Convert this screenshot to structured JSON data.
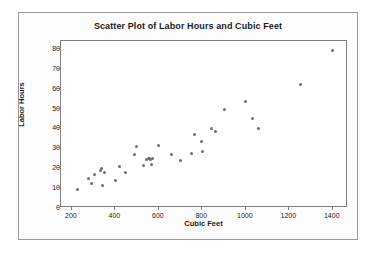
{
  "chart_data": {
    "type": "scatter",
    "title": "Scatter Plot of Labor Hours and Cubic Feet",
    "xlabel": "Cubic Feet",
    "ylabel": "Labor Hours",
    "xlim": [
      150,
      1470
    ],
    "ylim": [
      0,
      84
    ],
    "xticks": [
      200,
      400,
      600,
      800,
      1000,
      1200,
      1400
    ],
    "xtick_labels": [
      "200",
      "400",
      "600",
      "800",
      "1000",
      "1200",
      "1400"
    ],
    "yticks": [
      0,
      10,
      20,
      30,
      40,
      50,
      60,
      70,
      80
    ],
    "ytick_labels": [
      "0",
      "10",
      "20",
      "30",
      "40",
      "50",
      "60",
      "70",
      "80"
    ],
    "grid": false,
    "legend": null,
    "marker": {
      "shape": "circle",
      "color": "#6e6e6e",
      "size": 3
    },
    "series": [
      {
        "name": "Labor Hours vs Cubic Feet",
        "points": [
          [
            225,
            9.1
          ],
          [
            278,
            15.0
          ],
          [
            288,
            12.1
          ],
          [
            305,
            16.6
          ],
          [
            333,
            19.0
          ],
          [
            338,
            19.9
          ],
          [
            340,
            11.3
          ],
          [
            348,
            18.1
          ],
          [
            400,
            13.6
          ],
          [
            418,
            20.8
          ],
          [
            447,
            17.9
          ],
          [
            490,
            26.8
          ],
          [
            495,
            30.8
          ],
          [
            528,
            21.2
          ],
          [
            545,
            24.6
          ],
          [
            552,
            24.9
          ],
          [
            557,
            25.0
          ],
          [
            562,
            24.2
          ],
          [
            566,
            21.9
          ],
          [
            572,
            24.8
          ],
          [
            600,
            31.6
          ],
          [
            658,
            26.8
          ],
          [
            700,
            23.9
          ],
          [
            752,
            27.6
          ],
          [
            762,
            36.8
          ],
          [
            795,
            33.6
          ],
          [
            800,
            28.3
          ],
          [
            840,
            39.8
          ],
          [
            862,
            38.5
          ],
          [
            900,
            49.6
          ],
          [
            1000,
            53.4
          ],
          [
            1030,
            44.8
          ],
          [
            1060,
            39.8
          ],
          [
            1250,
            62.0
          ],
          [
            1400,
            79.2
          ]
        ]
      }
    ]
  },
  "figure": {
    "title": "Scatter Plot of Labor Hours and Cubic Feet"
  }
}
